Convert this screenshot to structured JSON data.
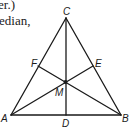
{
  "text_fragments": [
    "er.)",
    "edian,"
  ],
  "diagram": {
    "type": "triangle-medians",
    "stroke_color": "#1a1a1a",
    "points": {
      "A": {
        "label": "A",
        "x": 11,
        "y": 115
      },
      "B": {
        "label": "B",
        "x": 121,
        "y": 115
      },
      "C": {
        "label": "C",
        "x": 66,
        "y": 18
      },
      "D": {
        "label": "D",
        "x": 66,
        "y": 115
      },
      "E": {
        "label": "E",
        "x": 93,
        "y": 66
      },
      "F": {
        "label": "F",
        "x": 38,
        "y": 66
      },
      "M": {
        "label": "M",
        "x": 65,
        "y": 82
      }
    },
    "segments": [
      [
        "A",
        "B"
      ],
      [
        "B",
        "C"
      ],
      [
        "C",
        "A"
      ],
      [
        "C",
        "D"
      ],
      [
        "A",
        "E"
      ],
      [
        "B",
        "F"
      ]
    ],
    "centroid": "M"
  }
}
